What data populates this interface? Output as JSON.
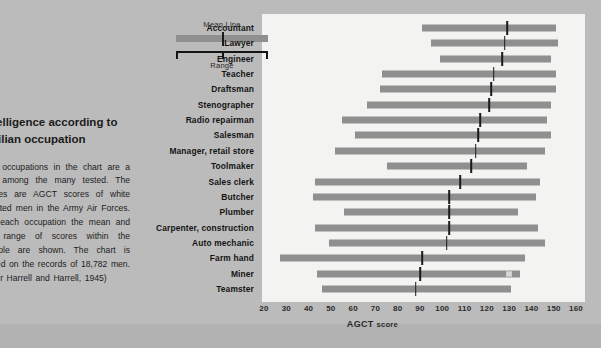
{
  "caption": {
    "figure_number": "5-6",
    "title": "Intelligence according to civilian occupation",
    "body": "The occupations in the chart are a few among the many tested. The scores are AGCT scores of white enlisted men in the Army Air Forces. For each occupation the mean and the range of scores within the sample are shown. The chart is based on the records of 18,782 men. (After Harrell and Harrell, 1945)"
  },
  "legend": {
    "mean_label": "Mean Line",
    "range_label": "Range"
  },
  "axis": {
    "title_main": "AGCT",
    "title_sub": "score",
    "ticks": [
      "20",
      "30",
      "40",
      "50",
      "60",
      "70",
      "80",
      "90",
      "100",
      "110",
      "120",
      "130",
      "140",
      "150",
      "160"
    ]
  },
  "colors": {
    "page_background": "#b9b9b9",
    "panel_background": "#f3f3f1",
    "bar": "#8f8f8f",
    "mean_line": "#1a1a1a",
    "text": "#141414"
  },
  "chart_data": {
    "type": "bar",
    "title": "Intelligence according to civilian occupation",
    "xlabel": "AGCT score",
    "ylabel": "",
    "xlim": [
      20,
      160
    ],
    "grid": false,
    "legend_position": "top-left",
    "categories": [
      "Accountant",
      "Lawyer",
      "Engineer",
      "Teacher",
      "Draftsman",
      "Stenographer",
      "Radio repairman",
      "Salesman",
      "Manager, retail store",
      "Toolmaker",
      "Sales clerk",
      "Butcher",
      "Plumber",
      "Carpenter, construction",
      "Auto mechanic",
      "Farm hand",
      "Miner",
      "Teamster"
    ],
    "series": [
      {
        "name": "range_min",
        "values": [
          91,
          95,
          99,
          73,
          72,
          66,
          55,
          61,
          52,
          75,
          43,
          42,
          56,
          43,
          49,
          27,
          44,
          46
        ]
      },
      {
        "name": "range_max",
        "values": [
          151,
          152,
          149,
          151,
          151,
          149,
          147,
          149,
          146,
          138,
          144,
          142,
          134,
          143,
          146,
          137,
          135,
          131
        ]
      },
      {
        "name": "mean",
        "values": [
          129,
          128,
          127,
          123,
          122,
          121,
          117,
          116,
          115,
          113,
          108,
          103,
          103,
          103,
          102,
          91,
          90,
          88
        ]
      }
    ]
  }
}
